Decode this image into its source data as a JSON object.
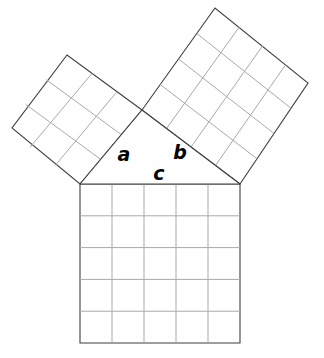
{
  "figure": {
    "background_color": "#ffffff",
    "outline_color": "#3f3f3f",
    "grid_color": "#a9a9a9",
    "label_color": "#000000",
    "labels": {
      "leg_a": "a",
      "leg_b": "b",
      "hypotenuse_c": "c"
    },
    "squares": [
      {
        "name": "square-on-leg-a",
        "label": "a",
        "side_units": 3,
        "grid_rows": 3,
        "grid_cols": 3,
        "area_units": 9,
        "corners": [
          [
            142,
            110
          ],
          [
            67,
            55
          ],
          [
            12,
            128
          ],
          [
            80,
            184
          ]
        ]
      },
      {
        "name": "square-on-leg-b",
        "label": "b",
        "side_units": 4,
        "grid_rows": 4,
        "grid_cols": 4,
        "area_units": 16,
        "corners": [
          [
            142,
            110
          ],
          [
            215,
            8
          ],
          [
            308,
            83
          ],
          [
            240,
            184
          ]
        ]
      },
      {
        "name": "square-on-hypotenuse-c",
        "label": "c",
        "side_units": 5,
        "grid_rows": 5,
        "grid_cols": 5,
        "area_units": 25,
        "corners": [
          [
            80,
            184
          ],
          [
            240,
            184
          ],
          [
            240,
            343
          ],
          [
            80,
            343
          ]
        ]
      }
    ],
    "triangle": {
      "name": "right-triangle",
      "vertices": [
        [
          142,
          110
        ],
        [
          80,
          184
        ],
        [
          240,
          184
        ]
      ],
      "right_angle_at": [
        142,
        110
      ]
    },
    "label_positions": {
      "a": [
        124,
        161
      ],
      "b": [
        180,
        159
      ],
      "c": [
        159,
        180
      ]
    }
  }
}
